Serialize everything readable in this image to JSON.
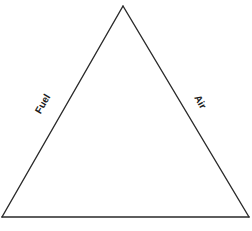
{
  "diagram": {
    "type": "fire-triangle",
    "stroke_color": "#2a2a2a",
    "background_color": "#ffffff",
    "vertices": {
      "apex": [
        123,
        6
      ],
      "bottom_left": [
        2,
        217
      ],
      "bottom_right": [
        249,
        217
      ]
    },
    "sides": {
      "left": {
        "label": "Fuel"
      },
      "right": {
        "label": "Air"
      },
      "bottom": {
        "label": ""
      }
    }
  }
}
